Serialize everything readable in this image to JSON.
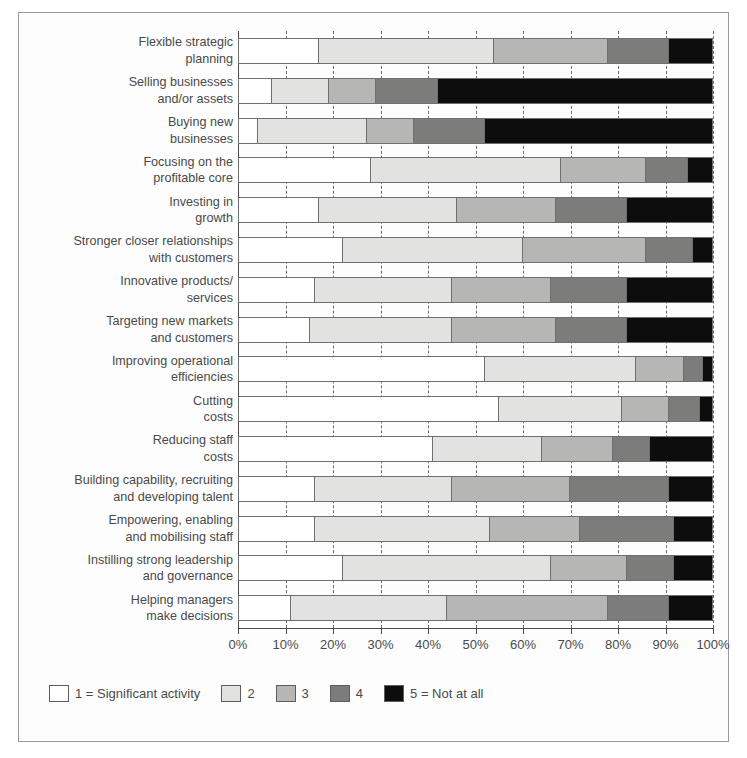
{
  "chart_data": {
    "type": "bar",
    "orientation": "horizontal",
    "stacked": true,
    "stack_mode": "percent",
    "title": "",
    "xlabel": "",
    "ylabel": "",
    "xlim": [
      0,
      100
    ],
    "grid": true,
    "legend_position": "bottom-left",
    "x_ticks": [
      "0%",
      "10%",
      "20%",
      "30%",
      "40%",
      "50%",
      "60%",
      "70%",
      "80%",
      "90%",
      "100%"
    ],
    "x_tick_values": [
      0,
      10,
      20,
      30,
      40,
      50,
      60,
      70,
      80,
      90,
      100
    ],
    "legend": [
      {
        "key": "1",
        "label": "1 = Significant activity",
        "color": "#ffffff"
      },
      {
        "key": "2",
        "label": "2",
        "color": "#e2e2e0"
      },
      {
        "key": "3",
        "label": "3",
        "color": "#b6b6b4"
      },
      {
        "key": "4",
        "label": "4",
        "color": "#7c7c7a"
      },
      {
        "key": "5",
        "label": "5 = Not at all",
        "color": "#0d0d0d"
      }
    ],
    "series": [
      {
        "name": "1 = Significant activity",
        "values": [
          17,
          7,
          4,
          28,
          17,
          22,
          16,
          15,
          52,
          55,
          41,
          16,
          16,
          22,
          11
        ]
      },
      {
        "name": "2",
        "values": [
          37,
          12,
          23,
          40,
          29,
          38,
          29,
          30,
          32,
          26,
          23,
          29,
          37,
          44,
          33
        ]
      },
      {
        "name": "3",
        "values": [
          24,
          10,
          10,
          18,
          21,
          26,
          21,
          22,
          10,
          10,
          15,
          25,
          19,
          16,
          34
        ]
      },
      {
        "name": "4",
        "values": [
          13,
          13,
          15,
          9,
          15,
          10,
          16,
          15,
          4,
          6.5,
          8,
          21,
          20,
          10,
          13
        ]
      },
      {
        "name": "5 = Not at all",
        "values": [
          9,
          58,
          48,
          5,
          18,
          4,
          18,
          18,
          2,
          2.5,
          13,
          9,
          8,
          8,
          9
        ]
      }
    ],
    "categories": [
      [
        "Flexible strategic",
        "planning"
      ],
      [
        "Selling businesses",
        "and/or assets"
      ],
      [
        "Buying new",
        "businesses"
      ],
      [
        "Focusing on the",
        "profitable core"
      ],
      [
        "Investing in",
        "growth"
      ],
      [
        "Stronger closer relationships",
        "with customers"
      ],
      [
        "Innovative products/",
        "services"
      ],
      [
        "Targeting new markets",
        "and customers"
      ],
      [
        "Improving operational",
        "efficiencies"
      ],
      [
        "Cutting",
        "costs"
      ],
      [
        "Reducing staff",
        "costs"
      ],
      [
        "Building capability, recruiting",
        "and developing talent"
      ],
      [
        "Empowering, enabling",
        "and mobilising staff"
      ],
      [
        "Instilling strong leadership",
        "and governance"
      ],
      [
        "Helping managers",
        "make decisions"
      ]
    ]
  }
}
